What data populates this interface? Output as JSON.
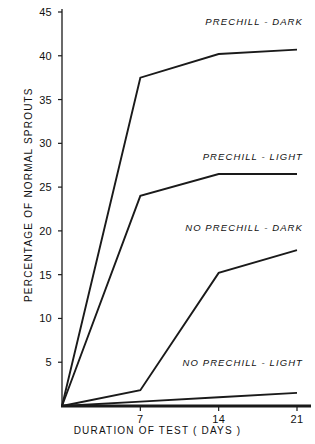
{
  "chart_data": {
    "type": "line",
    "title": "",
    "subtitle": "",
    "xlabel": "DURATION  OF  TEST  ( DAYS )",
    "ylabel": "PERCENTAGE  OF  NORMAL  SPROUTS",
    "x": [
      0,
      7,
      14,
      21
    ],
    "xlim": [
      0,
      21
    ],
    "ylim": [
      0,
      46
    ],
    "xticks": [
      7,
      14,
      21
    ],
    "xtick_labels": [
      "7",
      "14",
      "21"
    ],
    "yticks": [
      5,
      10,
      15,
      20,
      25,
      30,
      35,
      40,
      45
    ],
    "ytick_labels": [
      "5",
      "10",
      "15",
      "20",
      "25",
      "30",
      "35",
      "40",
      "45"
    ],
    "grid": false,
    "legend_position": "inline-annotations",
    "line_color": "#1a1a1a",
    "series": [
      {
        "name": "PRECHILL  -  DARK",
        "values": [
          0,
          37.5,
          40.2,
          40.7
        ],
        "label_x": 21,
        "label_y": 44
      },
      {
        "name": "PRECHILL  -  LIGHT",
        "values": [
          0,
          24.0,
          26.5,
          26.5
        ],
        "label_x": 21,
        "label_y": 28.5
      },
      {
        "name": "NO  PRECHILL  -  DARK",
        "values": [
          0,
          1.8,
          15.2,
          17.8
        ],
        "label_x": 21,
        "label_y": 20.5
      },
      {
        "name": "NO  PRECHILL  -  LIGHT",
        "values": [
          0,
          0.5,
          1.0,
          1.5
        ],
        "label_x": 21,
        "label_y": 5.0
      }
    ]
  }
}
